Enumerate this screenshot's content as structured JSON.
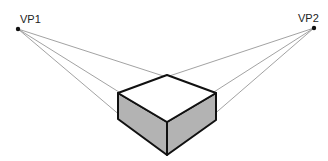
{
  "diagram": {
    "type": "two-point-perspective",
    "colors": {
      "background": "#ffffff",
      "construction_line": "#8a8a8a",
      "edge": "#111111",
      "side_fill": "#b3b3b3",
      "top_fill": "#ffffff",
      "vanishing_point": "#111111"
    },
    "vanishing_points": [
      {
        "id": "vp1",
        "label": "VP1",
        "x": 18,
        "y": 29
      },
      {
        "id": "vp2",
        "label": "VP2",
        "x": 314,
        "y": 28
      }
    ],
    "box": {
      "top_back": [
        167,
        75
      ],
      "top_left": [
        118,
        93
      ],
      "top_right": [
        216,
        93
      ],
      "top_front": [
        167,
        122
      ],
      "bottom_left": [
        118,
        119
      ],
      "bottom_right": [
        216,
        120
      ],
      "bottom_front": [
        167,
        155
      ]
    }
  }
}
